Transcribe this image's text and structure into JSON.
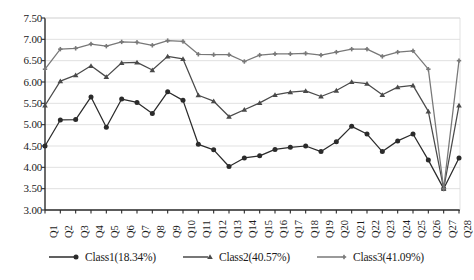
{
  "chart_data": {
    "type": "line",
    "title": "",
    "xlabel": "",
    "ylabel": "",
    "ylim": [
      3.0,
      7.5
    ],
    "ytick_labels": [
      "7.50",
      "7.00",
      "6.50",
      "6.00",
      "5.50",
      "5.00",
      "4.50",
      "4.00",
      "3.50",
      "3.00"
    ],
    "ytick_values": [
      7.5,
      7.0,
      6.5,
      6.0,
      5.5,
      5.0,
      4.5,
      4.0,
      3.5,
      3.0
    ],
    "grid": true,
    "grid_axis": "y",
    "legend_position": "bottom",
    "categories": [
      "Q1",
      "Q2",
      "Q3",
      "Q4",
      "Q5",
      "Q6",
      "Q7",
      "Q8",
      "Q9",
      "Q10",
      "Q11",
      "Q12",
      "Q13",
      "Q14",
      "Q15",
      "Q16",
      "Q17",
      "Q18",
      "Q19",
      "Q20",
      "Q21",
      "Q22",
      "Q23",
      "Q24",
      "Q25",
      "Q26",
      "Q27",
      "Q28"
    ],
    "series": [
      {
        "name": "Class1(18.34%)",
        "color": "#2b2b2b",
        "marker": "circle",
        "values": [
          4.5,
          5.11,
          5.12,
          5.65,
          4.94,
          5.6,
          5.52,
          5.26,
          5.77,
          5.57,
          4.54,
          4.41,
          4.02,
          4.22,
          4.27,
          4.42,
          4.47,
          4.5,
          4.37,
          4.6,
          4.96,
          4.78,
          4.37,
          4.62,
          4.78,
          4.17,
          3.5,
          4.22
        ]
      },
      {
        "name": "Class2(40.57%)",
        "color": "#4a4a4a",
        "marker": "triangle",
        "values": [
          5.45,
          6.02,
          6.16,
          6.38,
          6.12,
          6.45,
          6.46,
          6.28,
          6.6,
          6.54,
          5.69,
          5.55,
          5.19,
          5.35,
          5.51,
          5.7,
          5.76,
          5.79,
          5.66,
          5.8,
          6.0,
          5.96,
          5.7,
          5.88,
          5.92,
          5.31,
          3.5,
          5.45
        ]
      },
      {
        "name": "Class3(41.09%)",
        "color": "#787878",
        "marker": "plus",
        "values": [
          6.3,
          6.77,
          6.79,
          6.89,
          6.84,
          6.94,
          6.93,
          6.86,
          6.97,
          6.95,
          6.65,
          6.64,
          6.64,
          6.48,
          6.63,
          6.66,
          6.66,
          6.67,
          6.63,
          6.7,
          6.77,
          6.77,
          6.6,
          6.7,
          6.73,
          6.3,
          3.5,
          6.5
        ]
      }
    ]
  },
  "axes": {
    "y_labels": [
      "7.50",
      "7.00",
      "6.50",
      "6.00",
      "5.50",
      "5.00",
      "4.50",
      "4.00",
      "3.50",
      "3.00"
    ],
    "x_labels": [
      "Q1",
      "Q2",
      "Q3",
      "Q4",
      "Q5",
      "Q6",
      "Q7",
      "Q8",
      "Q9",
      "Q10",
      "Q11",
      "Q12",
      "Q13",
      "Q14",
      "Q15",
      "Q16",
      "Q17",
      "Q18",
      "Q19",
      "Q20",
      "Q21",
      "Q22",
      "Q23",
      "Q24",
      "Q25",
      "Q26",
      "Q27",
      "Q28"
    ]
  },
  "legend": {
    "items": [
      {
        "label": "Class1(18.34%)",
        "color": "#2b2b2b",
        "marker": "circle"
      },
      {
        "label": "Class2(40.57%)",
        "color": "#4a4a4a",
        "marker": "triangle"
      },
      {
        "label": "Class3(41.09%)",
        "color": "#787878",
        "marker": "plus"
      }
    ]
  },
  "caption": {
    "text": ""
  },
  "colors": {
    "grid": "#d9d9d9",
    "axis": "#2b2b2b",
    "background": "#ffffff"
  }
}
